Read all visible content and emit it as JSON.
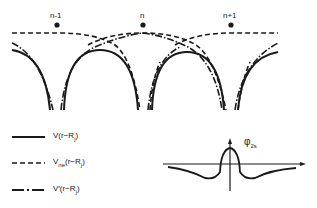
{
  "diagram": {
    "sites": [
      {
        "label": "n-1",
        "x": 57
      },
      {
        "label": "n",
        "x": 143
      },
      {
        "label": "n+1",
        "x": 231
      }
    ],
    "legend": [
      {
        "style": "solid",
        "label_main": "V(r−R",
        "label_sub": "j",
        "label_end": ")"
      },
      {
        "style": "dashed",
        "label_main": "V",
        "label_mid_sub": "ne",
        "label_rest": "(r−R",
        "label_sub": "j",
        "label_end": ")"
      },
      {
        "style": "dash-dot",
        "label_main": "V′(r−R",
        "label_sub": "j",
        "label_end": ")"
      }
    ],
    "inset": {
      "symbol": "φ",
      "subscript": "2s",
      "description": "wavefunction with central peak and negative side lobes"
    },
    "colors": {
      "ink": "#1a1a1a",
      "background": "#ffffff"
    }
  }
}
